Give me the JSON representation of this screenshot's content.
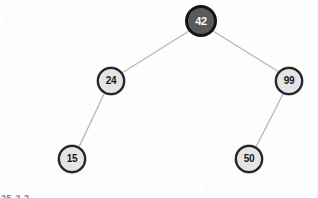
{
  "diagram": {
    "type": "binary-search-tree",
    "background_color": "#fdfdfd",
    "edge_color": "#b9b9bb",
    "caption": "25 2.2",
    "nodes": [
      {
        "id": "root",
        "label": "42",
        "cx": 201,
        "cy": 21,
        "r": 16,
        "style": "root",
        "fill": "#5a5a5c",
        "stroke": "#141416",
        "text_color": "#ffffff",
        "font_size": 11
      },
      {
        "id": "left",
        "label": "24",
        "cx": 111,
        "cy": 81,
        "r": 14,
        "style": "normal",
        "fill": "#e4e4e4",
        "stroke": "#222224",
        "text_color": "#17171a",
        "font_size": 10
      },
      {
        "id": "right",
        "label": "99",
        "cx": 289,
        "cy": 81,
        "r": 14,
        "style": "normal",
        "fill": "#e4e4e4",
        "stroke": "#222224",
        "text_color": "#17171a",
        "font_size": 10
      },
      {
        "id": "left-left",
        "label": "15",
        "cx": 72,
        "cy": 159,
        "r": 14,
        "style": "normal",
        "fill": "#e4e4e4",
        "stroke": "#222224",
        "text_color": "#17171a",
        "font_size": 10
      },
      {
        "id": "right-left",
        "label": "50",
        "cx": 249,
        "cy": 159,
        "r": 14,
        "style": "normal",
        "fill": "#e4e4e4",
        "stroke": "#222224",
        "text_color": "#17171a",
        "font_size": 10
      }
    ],
    "edges": [
      {
        "id": "edge-root-left",
        "from": "root",
        "to": "left",
        "x1": 189,
        "y1": 31,
        "x2": 122,
        "y2": 73
      },
      {
        "id": "edge-root-right",
        "from": "root",
        "to": "right",
        "x1": 213,
        "y1": 31,
        "x2": 279,
        "y2": 72
      },
      {
        "id": "edge-left-leftleft",
        "from": "left",
        "to": "left-left",
        "x1": 104,
        "y1": 94,
        "x2": 79,
        "y2": 147
      },
      {
        "id": "edge-right-rightleft",
        "from": "right",
        "to": "right-left",
        "x1": 283,
        "y1": 94,
        "x2": 256,
        "y2": 147
      }
    ]
  }
}
